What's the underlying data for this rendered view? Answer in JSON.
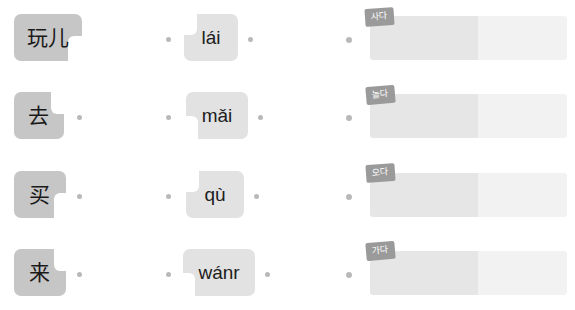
{
  "exercise": {
    "type": "matching",
    "row_count": 4,
    "column_count": 3
  },
  "colors": {
    "page_background": "#ffffff",
    "chinese_tile": "#c6c6c6",
    "pinyin_tile": "#e2e2e2",
    "bar_left_segment": "#e6e6e6",
    "bar_right_segment": "#f2f2f2",
    "korean_tag": "#9a9a9a",
    "korean_tag_text": "#ffffff",
    "connector_dot": "#b9b9b9"
  },
  "rows": [
    {
      "chinese": "玩儿",
      "pinyin": "lái",
      "korean": "사다",
      "chinese_width": "wide"
    },
    {
      "chinese": "去",
      "pinyin": "mǎi",
      "korean": "놀다",
      "chinese_width": "mid"
    },
    {
      "chinese": "买",
      "pinyin": "qù",
      "korean": "오다",
      "chinese_width": "narrow"
    },
    {
      "chinese": "来",
      "pinyin": "wánr",
      "korean": "가다",
      "chinese_width": "narrow"
    }
  ]
}
